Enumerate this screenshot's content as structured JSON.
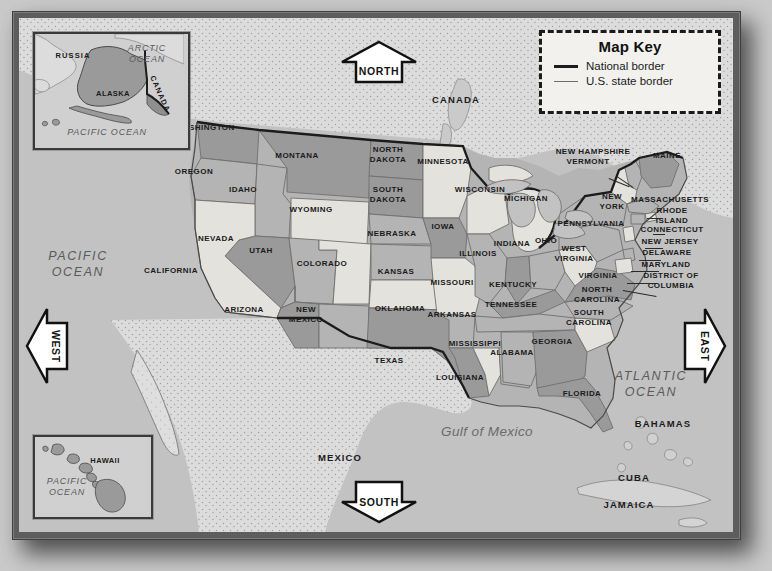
{
  "map": {
    "title": "Map of the United States",
    "key": {
      "title": "Map Key",
      "items": [
        {
          "label": "National border",
          "style": "national",
          "color": "#1c1c1c"
        },
        {
          "label": "U.S. state border",
          "style": "state",
          "color": "#6f6f6f"
        }
      ]
    },
    "compass": [
      {
        "id": "north",
        "label": "NORTH",
        "direction": "up"
      },
      {
        "id": "south",
        "label": "SOUTH",
        "direction": "down"
      },
      {
        "id": "west",
        "label": "WEST",
        "direction": "left"
      },
      {
        "id": "east",
        "label": "EAST",
        "direction": "right"
      }
    ],
    "countries": [
      {
        "name": "CANADA",
        "x": 456,
        "y": 100
      },
      {
        "name": "MEXICO",
        "x": 340,
        "y": 458
      },
      {
        "name": "BAHAMAS",
        "x": 663,
        "y": 424
      },
      {
        "name": "CUBA",
        "x": 634,
        "y": 478
      },
      {
        "name": "JAMAICA",
        "x": 629,
        "y": 505
      }
    ],
    "oceans": [
      {
        "name": "PACIFIC\nOCEAN",
        "x": 78,
        "y": 264
      },
      {
        "name": "ATLANTIC\nOCEAN",
        "x": 651,
        "y": 384
      },
      {
        "name": "Gulf of Mexico",
        "x": 487,
        "y": 432
      }
    ],
    "insets": [
      {
        "id": "alaska",
        "labels": [
          {
            "name": "RUSSIA",
            "x": 38,
            "y": 42,
            "kind": "country"
          },
          {
            "name": "ALASKA",
            "x": 98,
            "y": 80,
            "kind": "state"
          },
          {
            "name": "CANADA",
            "x": 140,
            "y": 80,
            "kind": "country"
          },
          {
            "name": "ARCTIC\nOCEAN",
            "x": 126,
            "y": 40,
            "kind": "ocean"
          },
          {
            "name": "PACIFIC OCEAN",
            "x": 90,
            "y": 120,
            "kind": "ocean"
          }
        ]
      },
      {
        "id": "hawaii",
        "labels": [
          {
            "name": "HAWAII",
            "x": 86,
            "y": 441,
            "kind": "state"
          },
          {
            "name": "PACIFIC\nOCEAN",
            "x": 45,
            "y": 470,
            "kind": "ocean"
          }
        ]
      }
    ],
    "states": [
      {
        "name": "WASHINGTON",
        "x": 205,
        "y": 128,
        "shade": "dark"
      },
      {
        "name": "OREGON",
        "x": 194,
        "y": 172,
        "shade": "mid"
      },
      {
        "name": "IDAHO",
        "x": 243,
        "y": 190,
        "shade": "mid"
      },
      {
        "name": "MONTANA",
        "x": 297,
        "y": 156,
        "shade": "dark"
      },
      {
        "name": "WYOMING",
        "x": 311,
        "y": 210,
        "shade": "light"
      },
      {
        "name": "NEVADA",
        "x": 216,
        "y": 239,
        "shade": "dark"
      },
      {
        "name": "UTAH",
        "x": 261,
        "y": 251,
        "shade": "mid"
      },
      {
        "name": "CALIFORNIA",
        "x": 171,
        "y": 271,
        "shade": "light"
      },
      {
        "name": "COLORADO",
        "x": 322,
        "y": 264,
        "shade": "light"
      },
      {
        "name": "ARIZONA",
        "x": 244,
        "y": 310,
        "shade": "dark"
      },
      {
        "name": "NEW\nMEXICO",
        "x": 306,
        "y": 314,
        "shade": "mid"
      },
      {
        "name": "NORTH\nDAKOTA",
        "x": 388,
        "y": 154,
        "shade": "dark"
      },
      {
        "name": "SOUTH\nDAKOTA",
        "x": 388,
        "y": 194,
        "shade": "dark"
      },
      {
        "name": "NEBRASKA",
        "x": 392,
        "y": 234,
        "shade": "mid"
      },
      {
        "name": "KANSAS",
        "x": 396,
        "y": 272,
        "shade": "mid"
      },
      {
        "name": "OKLAHOMA",
        "x": 400,
        "y": 309,
        "shade": "light"
      },
      {
        "name": "TEXAS",
        "x": 389,
        "y": 361,
        "shade": "dark"
      },
      {
        "name": "MINNESOTA",
        "x": 443,
        "y": 162,
        "shade": "light"
      },
      {
        "name": "IOWA",
        "x": 443,
        "y": 227,
        "shade": "dark"
      },
      {
        "name": "MISSOURI",
        "x": 452,
        "y": 283,
        "shade": "light"
      },
      {
        "name": "ARKANSAS",
        "x": 452,
        "y": 315,
        "shade": "mid"
      },
      {
        "name": "LOUISIANA",
        "x": 460,
        "y": 378,
        "shade": "dark"
      },
      {
        "name": "WISCONSIN",
        "x": 480,
        "y": 190,
        "shade": "light"
      },
      {
        "name": "ILLINOIS",
        "x": 478,
        "y": 254,
        "shade": "mid"
      },
      {
        "name": "MISSISSIPPI",
        "x": 475,
        "y": 344,
        "shade": "light"
      },
      {
        "name": "MICHIGAN",
        "x": 526,
        "y": 199,
        "shade": "light"
      },
      {
        "name": "INDIANA",
        "x": 512,
        "y": 244,
        "shade": "dark"
      },
      {
        "name": "OHIO",
        "x": 546,
        "y": 241,
        "shade": "mid"
      },
      {
        "name": "KENTUCKY",
        "x": 513,
        "y": 285,
        "shade": "dark"
      },
      {
        "name": "TENNESSEE",
        "x": 511,
        "y": 305,
        "shade": "mid"
      },
      {
        "name": "ALABAMA",
        "x": 512,
        "y": 353,
        "shade": "mid"
      },
      {
        "name": "GEORGIA",
        "x": 552,
        "y": 342,
        "shade": "dark"
      },
      {
        "name": "FLORIDA",
        "x": 582,
        "y": 394,
        "shade": "dark"
      },
      {
        "name": "SOUTH\nCAROLINA",
        "x": 589,
        "y": 317,
        "shade": "light"
      },
      {
        "name": "NORTH\nCAROLINA",
        "x": 597,
        "y": 294,
        "shade": "mid"
      },
      {
        "name": "WEST\nVIRGINIA",
        "x": 574,
        "y": 253,
        "shade": "light"
      },
      {
        "name": "VIRGINIA",
        "x": 598,
        "y": 276,
        "shade": "dark"
      },
      {
        "name": "PENNSYLVANIA",
        "x": 591,
        "y": 224,
        "shade": "mid"
      },
      {
        "name": "NEW\nYORK",
        "x": 612,
        "y": 201,
        "shade": "mid"
      },
      {
        "name": "NEW HAMPSHIRE",
        "x": 593,
        "y": 152,
        "shade": "light"
      },
      {
        "name": "VERMONT",
        "x": 588,
        "y": 162,
        "shade": "mid"
      },
      {
        "name": "MAINE",
        "x": 667,
        "y": 156,
        "shade": "dark"
      },
      {
        "name": "MASSACHUSETTS",
        "x": 670,
        "y": 200,
        "shade": "mid"
      },
      {
        "name": "RHODE\nISLAND",
        "x": 672,
        "y": 215,
        "shade": "light"
      },
      {
        "name": "CONNECTICUT",
        "x": 672,
        "y": 230,
        "shade": "mid"
      },
      {
        "name": "NEW JERSEY",
        "x": 670,
        "y": 242,
        "shade": "light"
      },
      {
        "name": "DELAWARE",
        "x": 667,
        "y": 253,
        "shade": "mid"
      },
      {
        "name": "MARYLAND",
        "x": 666,
        "y": 265,
        "shade": "light"
      },
      {
        "name": "DISTRICT OF\nCOLUMBIA",
        "x": 671,
        "y": 280,
        "shade": "mid"
      }
    ],
    "colors": {
      "ocean": "#c2c2c2",
      "land_neighbor": "#dcdcdc",
      "state_dark": "#9a9a9a",
      "state_mid": "#b4b4b4",
      "state_light": "#e4e2dc",
      "border_national": "#1c1c1c",
      "border_state": "#6f6f6f",
      "frame": "#5d5d5d",
      "page_background": "#c9c9c9",
      "key_background": "#f2f1ee"
    }
  }
}
